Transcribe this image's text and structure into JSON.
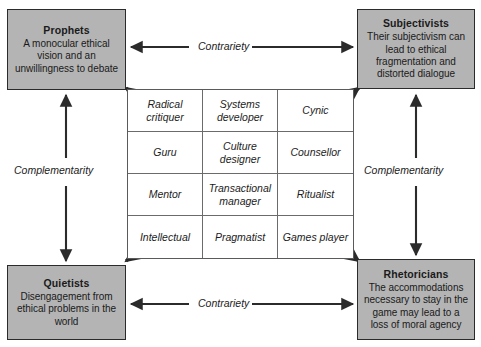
{
  "diagram": {
    "corners": [
      {
        "id": "prophets",
        "title": "Prophets",
        "description": "A monocular ethical vision and an unwillingness to debate"
      },
      {
        "id": "subjectivists",
        "title": "Subjectivists",
        "description": "Their subjectivism can lead to ethical fragmentation and distorted dialogue"
      },
      {
        "id": "quietists",
        "title": "Quietists",
        "description": "Disengagement from ethical problems in the world"
      },
      {
        "id": "rhetoricians",
        "title": "Rhetoricians",
        "description": "The accommodations necessary to stay in the game may lead to a loss of moral agency"
      }
    ],
    "relations": {
      "contrariety_top": "Contrariety",
      "contrariety_bottom": "Contrariety",
      "complementarity_left": "Complementarity",
      "complementarity_right": "Complementarity"
    },
    "grid": {
      "columns": 3,
      "rows": 4,
      "cells": [
        "Radical critiquer",
        "Systems developer",
        "Cynic",
        "Guru",
        "Culture designer",
        "Counsellor",
        "Mentor",
        "Transactional manager",
        "Ritualist",
        "Intellectual",
        "Pragmatist",
        "Games player"
      ]
    },
    "colors": {
      "box_fill": "#b4b4b4",
      "box_border": "#2b2b2b",
      "arrow": "#2b2b2b",
      "grid_line": "#6b6b6b",
      "text": "#1a1a1a",
      "background": "#ffffff"
    }
  }
}
